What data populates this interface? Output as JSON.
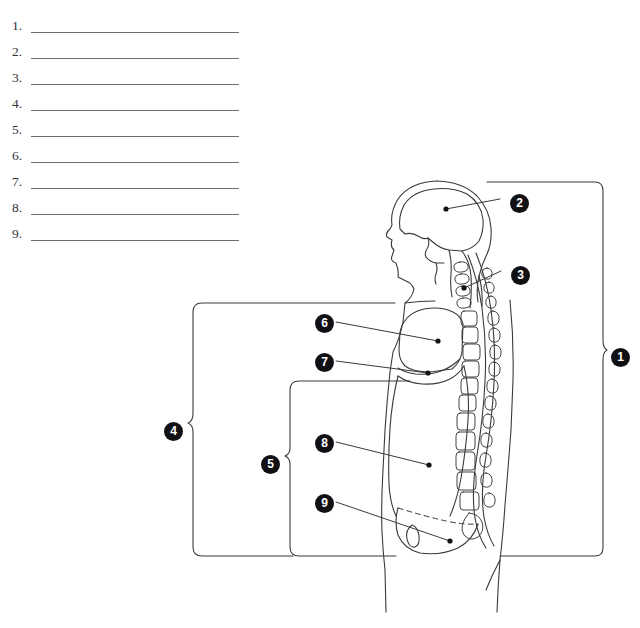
{
  "worksheet": {
    "clipped_header_text": "· ·  · ·  · · ·",
    "answer_list": [
      {
        "number": "1."
      },
      {
        "number": "2."
      },
      {
        "number": "3."
      },
      {
        "number": "4."
      },
      {
        "number": "5."
      },
      {
        "number": "6."
      },
      {
        "number": "7."
      },
      {
        "number": "8."
      },
      {
        "number": "9."
      }
    ]
  },
  "diagram": {
    "type": "anatomy-labeling-diagram",
    "view": "lateral-sagittal-human-body-cavities",
    "line_color": "#3a3a3e",
    "badge_color": "#111115",
    "badge_text_color": "#ffffff",
    "callouts": [
      {
        "id": "1",
        "label": "1",
        "x": 611,
        "y": 348,
        "marker": "brace-right"
      },
      {
        "id": "2",
        "label": "2",
        "x": 510,
        "y": 194,
        "marker": "leader-dot"
      },
      {
        "id": "3",
        "label": "3",
        "x": 511,
        "y": 266,
        "marker": "leader-dot"
      },
      {
        "id": "4",
        "label": "4",
        "x": 164,
        "y": 422,
        "marker": "brace-left"
      },
      {
        "id": "5",
        "label": "5",
        "x": 261,
        "y": 455,
        "marker": "brace-left"
      },
      {
        "id": "6",
        "label": "6",
        "x": 315,
        "y": 314,
        "marker": "leader-dot"
      },
      {
        "id": "7",
        "label": "7",
        "x": 315,
        "y": 353,
        "marker": "leader-dot"
      },
      {
        "id": "8",
        "label": "8",
        "x": 315,
        "y": 434,
        "marker": "leader-dot"
      },
      {
        "id": "9",
        "label": "9",
        "x": 315,
        "y": 494,
        "marker": "leader-dot"
      }
    ]
  }
}
